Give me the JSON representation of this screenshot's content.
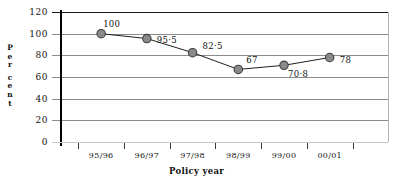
{
  "chart_data": {
    "type": "line",
    "title": "",
    "xlabel": "Policy year",
    "ylabel": "Per cent",
    "categories": [
      "95/96",
      "96/97",
      "97/98",
      "98/99",
      "99/00",
      "00/01"
    ],
    "values": [
      100,
      95.5,
      82.5,
      67,
      70.8,
      78
    ],
    "point_labels": [
      "100",
      "95·5",
      "82·5",
      "67",
      "70·8",
      "78"
    ],
    "series": [
      {
        "name": "Per cent",
        "values": [
          100,
          95.5,
          82.5,
          67,
          70.8,
          78
        ]
      }
    ],
    "ylim": [
      0,
      120
    ],
    "yticks": [
      120,
      100,
      80,
      60,
      40,
      20,
      0
    ],
    "ytick_labels": [
      "120",
      "100",
      "80",
      "60",
      "40",
      "20",
      "0"
    ],
    "grid": true,
    "legend": "none",
    "marker": "filled-circle",
    "marker_color": "#8a8a8a",
    "marker_edge_color": "#3d3d3d",
    "line_color": "#1f1f1f",
    "gridline_color": "#8c8c8c",
    "axis_color": "#000000"
  },
  "y_axis_title_letters": [
    "P",
    "e",
    "r",
    "",
    "c",
    "e",
    "n",
    "t"
  ]
}
